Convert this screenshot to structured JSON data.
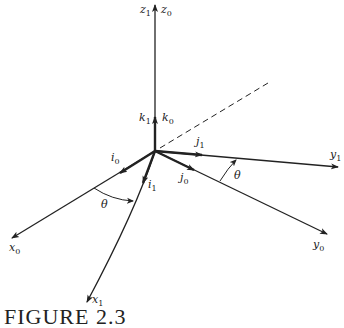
{
  "diagram": {
    "type": "coordinate-frame-rotation",
    "origin": [
      155,
      151
    ],
    "axes": [
      {
        "id": "z",
        "label_a": "z",
        "sub_a": "1",
        "label_b": "z",
        "sub_b": "0",
        "end": [
          155,
          5
        ]
      },
      {
        "id": "y1",
        "label": "y",
        "sub": "1",
        "end": [
          338,
          167
        ]
      },
      {
        "id": "y0",
        "label": "y",
        "sub": "0",
        "end": [
          327,
          234
        ]
      },
      {
        "id": "x0",
        "label": "x",
        "sub": "0",
        "end": [
          12,
          238
        ]
      },
      {
        "id": "x1",
        "label": "x",
        "sub": "1",
        "end": [
          87,
          302
        ]
      }
    ],
    "unit_vectors": [
      {
        "label": "k",
        "sub": "1"
      },
      {
        "label": "k",
        "sub": "0"
      },
      {
        "label": "i",
        "sub": "0"
      },
      {
        "label": "i",
        "sub": "1"
      },
      {
        "label": "j",
        "sub": "1"
      },
      {
        "label": "j",
        "sub": "0"
      }
    ],
    "angles": [
      {
        "label": "θ",
        "between": "x0-x1"
      },
      {
        "label": "θ",
        "between": "y0-y1"
      }
    ],
    "dashed_line": {
      "start": [
        160,
        148
      ],
      "end": [
        268,
        83
      ]
    }
  },
  "labels": {
    "z1": "z",
    "z1_sub": "1",
    "z0": "z",
    "z0_sub": "0",
    "k1": "k",
    "k1_sub": "1",
    "k0": "k",
    "k0_sub": "0",
    "i0": "i",
    "i0_sub": "0",
    "i1": "i",
    "i1_sub": "1",
    "j1": "j",
    "j1_sub": "1",
    "j0": "j",
    "j0_sub": "0",
    "y1": "y",
    "y1_sub": "1",
    "y0": "y",
    "y0_sub": "0",
    "x0": "x",
    "x0_sub": "0",
    "x1": "x",
    "x1_sub": "1",
    "theta_x": "θ",
    "theta_y": "θ"
  },
  "caption": "FIGURE 2.3"
}
